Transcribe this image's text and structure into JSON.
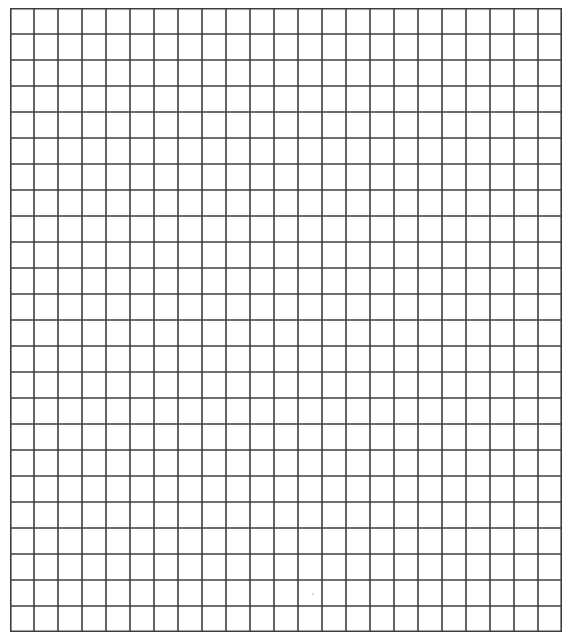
{
  "page": {
    "description": "Blank square grid paper",
    "background_color": "#ffffff"
  },
  "grid": {
    "columns": 23,
    "rows": 24,
    "cell_width_px": 24,
    "cell_height_px": 26,
    "origin_x_px": 10,
    "origin_y_px": 8,
    "width_px": 552,
    "height_px": 624,
    "line_color": "#3d3d3d",
    "line_width_px": 1.6
  }
}
